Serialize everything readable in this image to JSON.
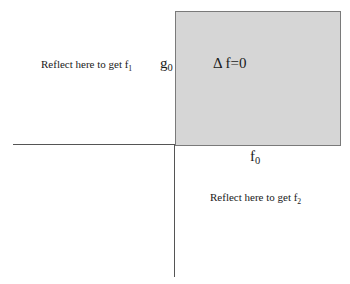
{
  "diagram": {
    "region": {
      "label_symbol": "Δ",
      "label_text": " f=0",
      "fill_color": "#d6d6d6",
      "border_color": "#7a7a7a"
    },
    "axes": {
      "vertical_label_base": "g",
      "vertical_label_sub": "0",
      "horizontal_label_base": "f",
      "horizontal_label_sub": "0"
    },
    "annotations": [
      {
        "text": "Reflect here to get f",
        "sub": "1"
      },
      {
        "text": "Reflect here to get f",
        "sub": "2"
      }
    ]
  }
}
